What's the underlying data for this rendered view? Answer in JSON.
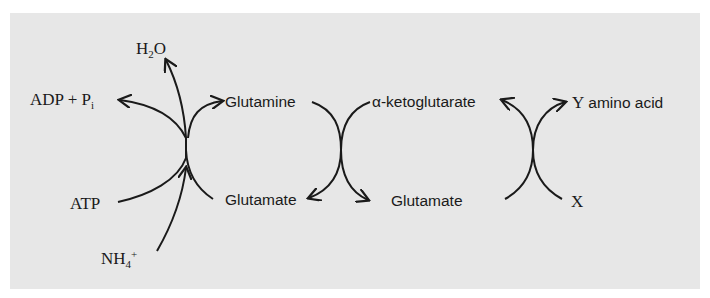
{
  "diagram": {
    "background_color": "#e7e7e7",
    "line_color": "#1a1a1a",
    "labels": {
      "water": {
        "main": "H",
        "sub": "2",
        "tail": "O"
      },
      "adp_pi": {
        "main": "ADP + P",
        "sub": "i"
      },
      "atp": "ATP",
      "ammonium": {
        "main": "NH",
        "sub": "4",
        "sup": "+"
      },
      "glutamine": "Glutamine",
      "glutamate_left": "Glutamate",
      "alpha_ketoglutarate": "α-ketoglutarate",
      "glutamate_middle": "Glutamate",
      "y_amino_acid": {
        "letter": "Y",
        "text": "amino acid"
      },
      "x": "X"
    },
    "reactions": [
      {
        "name": "glutamine-synthesis",
        "inputs": [
          "Glutamate",
          "ATP",
          "NH4+"
        ],
        "outputs": [
          "Glutamine",
          "ADP + Pi",
          "H2O"
        ]
      },
      {
        "name": "glutamine-to-glutamate",
        "inputs": [
          "Glutamine",
          "α-ketoglutarate"
        ],
        "outputs": [
          "Glutamate",
          "Glutamate"
        ]
      },
      {
        "name": "transamination",
        "inputs": [
          "Glutamate",
          "X"
        ],
        "outputs": [
          "α-ketoglutarate",
          "Y amino acid"
        ]
      }
    ]
  }
}
